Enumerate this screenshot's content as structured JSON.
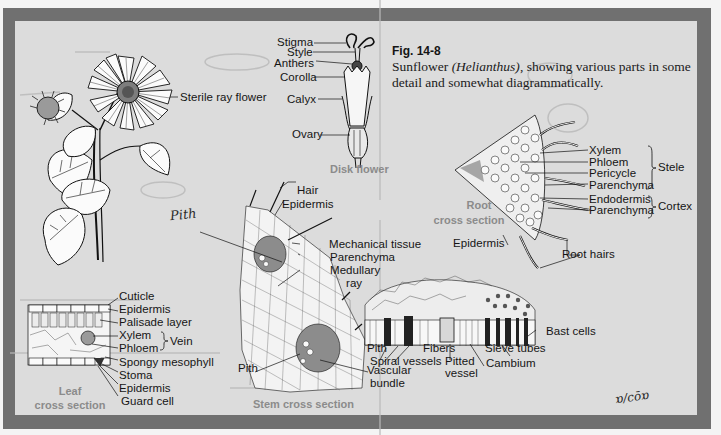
{
  "figure": {
    "number": "Fig. 14-8",
    "caption_prefix": "Sunflower ",
    "caption_italic": "(Helianthus)",
    "caption_suffix": ", showing various parts in some detail and somewhat diagrammatically."
  },
  "colors": {
    "frame": "#707070",
    "panel": "#dcdcdc",
    "label_text": "#151515",
    "section_caption": "#8b8b8b"
  },
  "plant": {
    "labels": {
      "sterile_ray_flower": "Sterile ray flower"
    }
  },
  "disk_flower": {
    "caption": "Disk flower",
    "labels": {
      "stigma": "Stigma",
      "style": "Style",
      "anthers": "Anthers",
      "corolla": "Corolla",
      "calyx": "Calyx",
      "ovary": "Ovary"
    }
  },
  "root_section": {
    "caption_line1": "Root",
    "caption_line2": "cross section",
    "labels": {
      "xylem": "Xylem",
      "phloem": "Phloem",
      "pericycle": "Pericycle",
      "parenchyma_stele": "Parenchyma",
      "endodermis": "Endodermis",
      "parenchyma_cortex": "Parenchyma",
      "epidermis": "Epidermis",
      "root_hairs": "Root hairs"
    },
    "groups": {
      "stele": "Stele",
      "cortex": "Cortex"
    }
  },
  "stem_section": {
    "caption": "Stem cross section",
    "labels": {
      "hair": "Hair",
      "epidermis": "Epidermis",
      "mechanical_tissue": "Mechanical tissue",
      "parenchyma": "Parenchyma",
      "medullary_ray_1": "Medullary",
      "medullary_ray_2": "ray",
      "pith": "Pith",
      "vascular_bundle_1": "Vascular",
      "vascular_bundle_2": "bundle"
    }
  },
  "bundle_detail": {
    "labels": {
      "pith": "Pith",
      "spiral_vessels": "Spiral vessels",
      "fibers": "Fibers",
      "pitted_vessel_1": "Pitted",
      "pitted_vessel_2": "vessel",
      "sieve_tubes": "Sieve tubes",
      "cambium": "Cambium",
      "bast_cells": "Bast cells"
    }
  },
  "leaf_section": {
    "caption_line1": "Leaf",
    "caption_line2": "cross section",
    "labels": {
      "cuticle": "Cuticle",
      "epidermis_upper": "Epidermis",
      "palisade_layer": "Palisade layer",
      "xylem": "Xylem",
      "phloem": "Phloem",
      "spongy_mesophyll": "Spongy mesophyll",
      "stoma": "Stoma",
      "epidermis_lower": "Epidermis",
      "guard_cell": "Guard cell"
    },
    "groups": {
      "vein": "Vein"
    }
  },
  "handwriting": {
    "pith_note": "Pith",
    "signature": "ɒ/cōɒ"
  }
}
